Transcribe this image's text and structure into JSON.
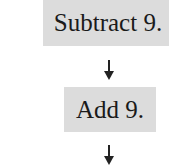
{
  "flowchart": {
    "steps": [
      {
        "label": "Subtract 9."
      },
      {
        "label": "Add 9."
      }
    ],
    "arrows": [
      {
        "direction": "down",
        "icon": "arrow-down-icon"
      },
      {
        "direction": "down",
        "icon": "arrow-down-icon"
      }
    ],
    "colors": {
      "box_fill": "#dcdcdc",
      "text": "#1a1a1a",
      "arrow": "#222222"
    }
  }
}
